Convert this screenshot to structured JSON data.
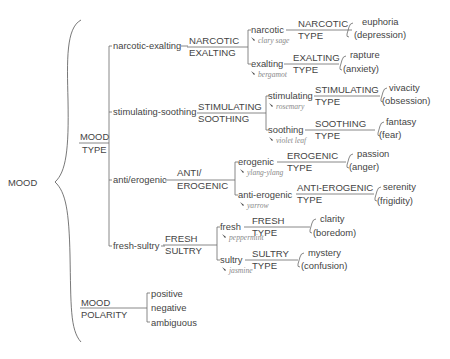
{
  "root": {
    "label": "MOOD"
  },
  "mood_type": {
    "label_top": "MOOD",
    "label_bottom": "TYPE",
    "groups": [
      {
        "name": "narcotic-exalting",
        "type_top": "NARCOTIC",
        "type_bottom": "EXALTING",
        "items": [
          {
            "name": "narcotic",
            "scent": "clary sage",
            "type_top": "NARCOTIC",
            "type_bottom": "TYPE",
            "positive": "euphoria",
            "negative": "(depression)"
          },
          {
            "name": "exalting",
            "scent": "bergamot",
            "type_top": "EXALTING",
            "type_bottom": "TYPE",
            "positive": "rapture",
            "negative": "(anxiety)"
          }
        ]
      },
      {
        "name": "stimulating-soothing",
        "type_top": "STIMULATING",
        "type_bottom": "SOOTHING",
        "items": [
          {
            "name": "stimulating",
            "scent": "rosemary",
            "type_top": "STIMULATING",
            "type_bottom": "TYPE",
            "positive": "vivacity",
            "negative": "(obsession)"
          },
          {
            "name": "soothing",
            "scent": "violet leaf",
            "type_top": "SOOTHING",
            "type_bottom": "TYPE",
            "positive": "fantasy",
            "negative": "(fear)"
          }
        ]
      },
      {
        "name": "anti/erogenic",
        "type_top": "ANTI/",
        "type_bottom": "EROGENIC",
        "items": [
          {
            "name": "erogenic",
            "scent": "ylang-ylang",
            "type_top": "EROGENIC",
            "type_bottom": "TYPE",
            "positive": "passion",
            "negative": "(anger)"
          },
          {
            "name": "anti-erogenic",
            "scent": "yarrow",
            "type_top": "ANTI-EROGENIC",
            "type_bottom": "TYPE",
            "positive": "serenity",
            "negative": "(frigidity)"
          }
        ]
      },
      {
        "name": "fresh-sultry",
        "type_top": "FRESH",
        "type_bottom": "SULTRY",
        "items": [
          {
            "name": "fresh",
            "scent": "peppermint",
            "type_top": "FRESH",
            "type_bottom": "TYPE",
            "positive": "clarity",
            "negative": "(boredom)"
          },
          {
            "name": "sultry",
            "scent": "jasmine",
            "type_top": "SULTRY",
            "type_bottom": "TYPE",
            "positive": "mystery",
            "negative": "(confusion)"
          }
        ]
      }
    ]
  },
  "mood_polarity": {
    "label_top": "MOOD",
    "label_bottom": "POLARITY",
    "items": [
      "positive",
      "negative",
      "ambiguous"
    ]
  },
  "colors": {
    "text": "#444444",
    "lines": "#6a6a6a",
    "scent": "#8a8a8a",
    "background": "#ffffff"
  }
}
